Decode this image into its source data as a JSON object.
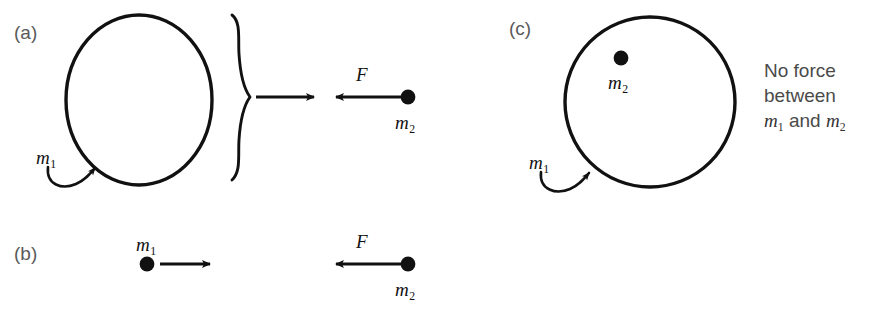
{
  "figure": {
    "background_color": "#ffffff",
    "stroke_color": "#111111",
    "label_color": "#5a5a5a",
    "note_color": "#4a4a4a"
  },
  "panels": {
    "a": {
      "label": "(a)",
      "mass_inner_label": "m",
      "mass_inner_sub": "1",
      "force_label": "F",
      "mass_point_label": "m",
      "mass_point_sub": "2"
    },
    "b": {
      "label": "(b)",
      "mass_left_label": "m",
      "mass_left_sub": "1",
      "force_label": "F",
      "mass_right_label": "m",
      "mass_right_sub": "2"
    },
    "c": {
      "label": "(c)",
      "mass_shell_label": "m",
      "mass_shell_sub": "1",
      "mass_inside_label": "m",
      "mass_inside_sub": "2",
      "note_line_1": "No force",
      "note_line_2": "between",
      "note_line_3_prefix": "m",
      "note_line_3_prefix_sub": "1",
      "note_line_3_middle": " and ",
      "note_line_3_suffix": "m",
      "note_line_3_suffix_sub": "2"
    }
  }
}
